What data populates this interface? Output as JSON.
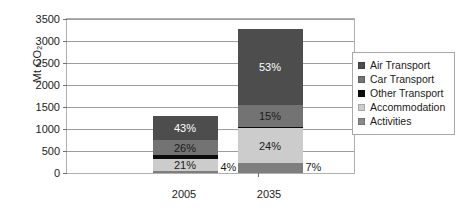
{
  "chart_data": {
    "type": "bar",
    "subtype": "stacked-bar",
    "title": "",
    "xlabel": "",
    "ylabel": "Mt CO2",
    "ylabel_display": "Mt CO",
    "ylabel_subscript": "2",
    "categories": [
      "2005",
      "2035"
    ],
    "ylim": [
      0,
      3500
    ],
    "ytick_step": 500,
    "yticks": [
      "3500",
      "3000",
      "2500",
      "2000",
      "1500",
      "1000",
      "500",
      "0"
    ],
    "grid": true,
    "legend_position": "right",
    "totals": [
      1300,
      3270
    ],
    "series": [
      {
        "name": "Activities",
        "color": "#7e7e7e",
        "percent_labels": [
          "4%",
          "7%"
        ],
        "label_inside": [
          false,
          false
        ],
        "percents": [
          4,
          7
        ],
        "values": [
          52,
          229
        ]
      },
      {
        "name": "Accommodation",
        "color": "#cccccc",
        "percent_labels": [
          "21%",
          "24%"
        ],
        "label_inside": [
          true,
          true
        ],
        "percents": [
          21,
          24
        ],
        "values": [
          273,
          785
        ]
      },
      {
        "name": "Other Transport",
        "color": "#0d0d0d",
        "percent_labels": [
          "",
          ""
        ],
        "label_inside": [
          false,
          false
        ],
        "percents": [
          6,
          1
        ],
        "values": [
          78,
          33
        ]
      },
      {
        "name": "Car Transport",
        "color": "#737373",
        "percent_labels": [
          "26%",
          "15%"
        ],
        "label_inside": [
          true,
          true
        ],
        "percents": [
          26,
          15
        ],
        "values": [
          338,
          490
        ]
      },
      {
        "name": "Air Transport",
        "color": "#4d4d4d",
        "percent_labels": [
          "43%",
          "53%"
        ],
        "label_inside": [
          true,
          true
        ],
        "percents": [
          43,
          53
        ],
        "values": [
          559,
          1733
        ]
      }
    ]
  },
  "legend": {
    "items": [
      {
        "label": "Air Transport",
        "color": "#4d4d4d"
      },
      {
        "label": "Car Transport",
        "color": "#737373"
      },
      {
        "label": "Other Transport",
        "color": "#0d0d0d"
      },
      {
        "label": "Accommodation",
        "color": "#cccccc"
      },
      {
        "label": "Activities",
        "color": "#8a8a8a"
      }
    ]
  }
}
